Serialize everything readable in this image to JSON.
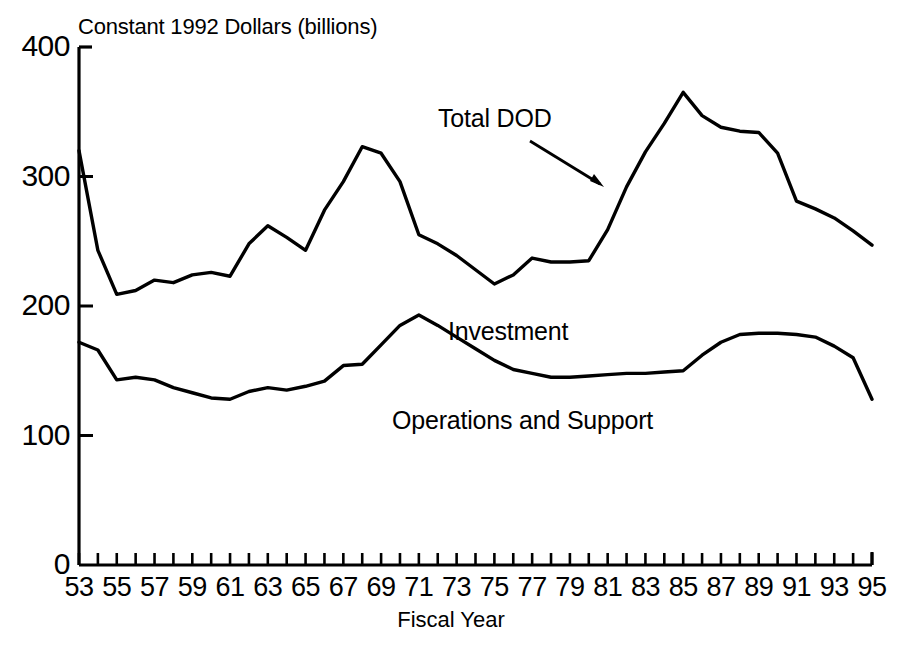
{
  "chart_data": {
    "type": "line",
    "title": "Constant 1992 Dollars (billions)",
    "xlabel": "Fiscal Year",
    "ylabel": "Constant 1992 Dollars (billions)",
    "xlim": [
      53,
      95
    ],
    "ylim": [
      0,
      400
    ],
    "grid": false,
    "legend_position": "inline-annotations",
    "y_ticks": [
      0,
      100,
      200,
      300,
      400
    ],
    "y_tick_labels": [
      "0",
      "100",
      "200",
      "300",
      "400"
    ],
    "x_ticks": [
      53,
      54,
      55,
      56,
      57,
      58,
      59,
      60,
      61,
      62,
      63,
      64,
      65,
      66,
      67,
      68,
      69,
      70,
      71,
      72,
      73,
      74,
      75,
      76,
      77,
      78,
      79,
      80,
      81,
      82,
      83,
      84,
      85,
      86,
      87,
      88,
      89,
      90,
      91,
      92,
      93,
      94,
      95
    ],
    "x_tick_labels": [
      "53",
      "55",
      "57",
      "59",
      "61",
      "63",
      "65",
      "67",
      "69",
      "71",
      "73",
      "75",
      "77",
      "79",
      "81",
      "83",
      "85",
      "87",
      "89",
      "91",
      "93",
      "95"
    ],
    "x_labeled_ticks": [
      53,
      55,
      57,
      59,
      61,
      63,
      65,
      67,
      69,
      71,
      73,
      75,
      77,
      79,
      81,
      83,
      85,
      87,
      89,
      91,
      93,
      95
    ],
    "x": [
      53,
      54,
      55,
      56,
      57,
      58,
      59,
      60,
      61,
      62,
      63,
      64,
      65,
      66,
      67,
      68,
      69,
      70,
      71,
      72,
      73,
      74,
      75,
      76,
      77,
      78,
      79,
      80,
      81,
      82,
      83,
      84,
      85,
      86,
      87,
      88,
      89,
      90,
      91,
      92,
      93,
      94,
      95
    ],
    "series": [
      {
        "name": "Total DOD",
        "annotation": "Total DOD",
        "annotation_arrow": true,
        "values": [
          320,
          243,
          209,
          212,
          220,
          218,
          224,
          226,
          223,
          248,
          262,
          253,
          243,
          274,
          296,
          323,
          318,
          296,
          255,
          248,
          239,
          228,
          217,
          224,
          237,
          234,
          234,
          235,
          259,
          292,
          319,
          341,
          365,
          347,
          338,
          335,
          334,
          318,
          281,
          275,
          268,
          258,
          247
        ]
      },
      {
        "name": "Operations and Support",
        "annotation": "Operations and Support",
        "annotation_above": "Investment",
        "values": [
          172,
          166,
          143,
          145,
          143,
          137,
          133,
          129,
          128,
          134,
          137,
          135,
          138,
          142,
          154,
          155,
          170,
          185,
          193,
          185,
          176,
          167,
          158,
          151,
          148,
          145,
          145,
          146,
          147,
          148,
          148,
          149,
          150,
          162,
          172,
          178,
          179,
          179,
          178,
          176,
          169,
          160,
          128
        ]
      }
    ],
    "annotations": [
      {
        "text": "Total DOD",
        "x": 70.5,
        "y": 340
      },
      {
        "text": "Investment",
        "x": 72.0,
        "y": 178
      },
      {
        "text": "Operations and Support",
        "x": 69.0,
        "y": 110
      }
    ]
  },
  "axes": {
    "y_title": "Constant 1992 Dollars (billions)",
    "x_title": "Fiscal Year"
  }
}
